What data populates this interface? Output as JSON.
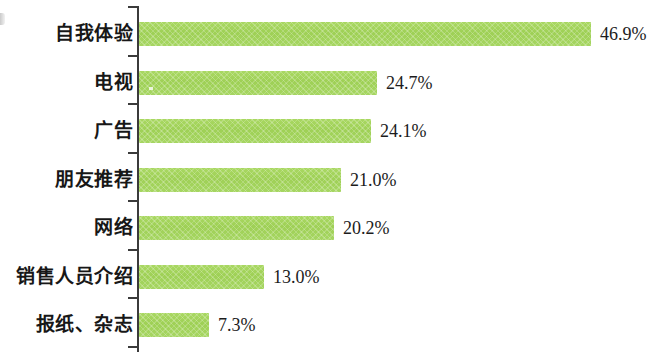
{
  "chart_data": {
    "type": "bar",
    "orientation": "horizontal",
    "title": "",
    "subtitle": "",
    "xlabel": "",
    "ylabel": "",
    "categories": [
      "自我体验",
      "电视",
      "广告",
      "朋友推荐",
      "网络",
      "销售人员介绍",
      "报纸、杂志"
    ],
    "values": [
      46.9,
      24.7,
      24.1,
      21.0,
      20.2,
      13.0,
      7.3
    ],
    "value_labels": [
      "46.9%",
      "24.7%",
      "24.1%",
      "21.0%",
      "20.2%",
      "13.0%",
      "7.3%"
    ],
    "xlim": [
      0,
      46.9
    ],
    "grid": false,
    "legend": null,
    "series": [
      {
        "name": "",
        "values": [
          46.9,
          24.7,
          24.1,
          21.0,
          20.2,
          13.0,
          7.3
        ]
      }
    ]
  },
  "style": {
    "bar_color": "#9fd156",
    "axis_color": "#3b3b3b",
    "text_color": "#171717",
    "background": "#ffffff"
  },
  "axis": {
    "tick_count": 8
  }
}
